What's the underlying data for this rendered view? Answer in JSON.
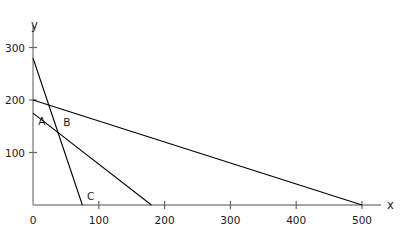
{
  "chart_data": {
    "type": "line",
    "title": "",
    "xlabel": "x",
    "ylabel": "y",
    "xlim": [
      0,
      550
    ],
    "ylim": [
      0,
      330
    ],
    "grid": false,
    "legend": null,
    "x_ticks": [
      {
        "value": 0,
        "label": "0"
      },
      {
        "value": 100,
        "label": "100"
      },
      {
        "value": 200,
        "label": "200"
      },
      {
        "value": 300,
        "label": "300"
      },
      {
        "value": 400,
        "label": "400"
      },
      {
        "value": 500,
        "label": "500"
      }
    ],
    "y_ticks": [
      {
        "value": 100,
        "label": "100"
      },
      {
        "value": 200,
        "label": "200"
      },
      {
        "value": 300,
        "label": "300"
      }
    ],
    "series": [
      {
        "name": "line-1",
        "x_intercept": 75,
        "y_intercept": 280,
        "points": [
          [
            0,
            280
          ],
          [
            75,
            0
          ]
        ],
        "color": "#000000"
      },
      {
        "name": "line-2",
        "x_intercept": 180,
        "y_intercept": 175,
        "points": [
          [
            0,
            175
          ],
          [
            180,
            0
          ]
        ],
        "color": "#000000"
      },
      {
        "name": "line-3",
        "x_intercept": 500,
        "y_intercept": 200,
        "points": [
          [
            0,
            200
          ],
          [
            500,
            0
          ]
        ],
        "color": "#000000"
      }
    ],
    "annotations": [
      {
        "label": "A",
        "x": 8,
        "y": 158
      },
      {
        "label": "B",
        "x": 46,
        "y": 156
      },
      {
        "label": "C",
        "x": 82,
        "y": 16
      }
    ]
  },
  "axes": {
    "y_axis_label": "y",
    "x_axis_label": "x"
  }
}
